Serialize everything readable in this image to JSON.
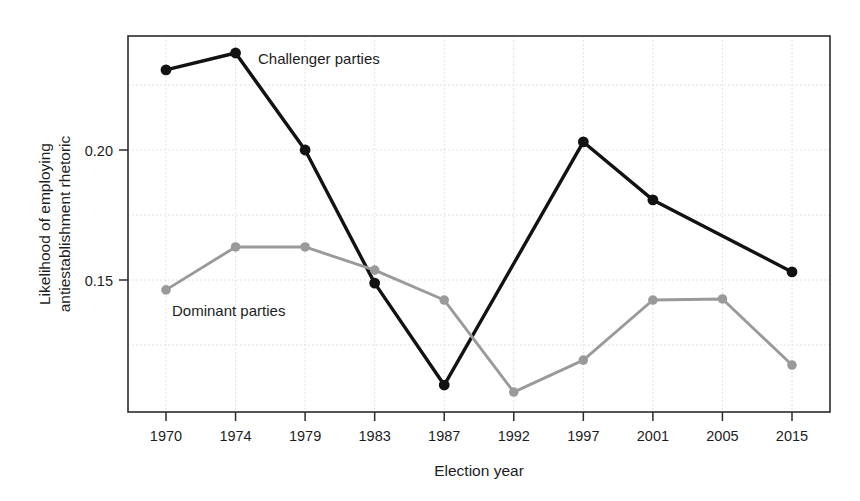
{
  "chart_data": {
    "type": "line",
    "title": "",
    "subtitle": "",
    "xlabel": "Election year",
    "ylabel": "Likelihood of employing antiestablishment rhetoric",
    "ylabel_line1": "Likelihood of employing",
    "ylabel_line2": "antiestablishment rhetoric",
    "categories": [
      "1970",
      "1974",
      "1979",
      "1983",
      "1987",
      "1992",
      "1997",
      "2001",
      "2005",
      "2015"
    ],
    "x": [
      1970,
      1974,
      1979,
      1983,
      1987,
      1992,
      1997,
      2001,
      2005,
      2015
    ],
    "xtick_labels": [
      "1970",
      "1974",
      "1979",
      "1983",
      "1987",
      "1992",
      "1997",
      "2001",
      "2005",
      "2015"
    ],
    "ytick_labels": [
      "0.20",
      "0.15"
    ],
    "ytick_values": [
      0.2,
      0.15
    ],
    "ylim": [
      0.1,
      0.2423
    ],
    "xlim_index": [
      -0.55,
      9.55
    ],
    "grid": true,
    "grid_style": "dotted",
    "legend_position": "inline-annotation",
    "series": [
      {
        "name": "Challenger parties",
        "label": "Challenger parties",
        "color": "#121212",
        "marker": "circle",
        "values": [
          0.2308,
          0.2373,
          0.2,
          0.1488,
          0.1096,
          null,
          0.2031,
          0.1808,
          null,
          0.1531
        ],
        "points": [
          {
            "x": "1970",
            "y": 0.2308
          },
          {
            "x": "1974",
            "y": 0.2373
          },
          {
            "x": "1979",
            "y": 0.2
          },
          {
            "x": "1983",
            "y": 0.1488
          },
          {
            "x": "1987",
            "y": 0.1096
          },
          {
            "x": "1997",
            "y": 0.2031
          },
          {
            "x": "2001",
            "y": 0.1808
          },
          {
            "x": "2015",
            "y": 0.1531
          }
        ]
      },
      {
        "name": "Dominant parties",
        "label": "Dominant parties",
        "color": "#9a9a9a",
        "marker": "circle",
        "values": [
          0.1462,
          0.1627,
          0.1627,
          0.1538,
          0.1423,
          0.1069,
          0.1192,
          0.1423,
          0.1427,
          0.1173
        ],
        "points": [
          {
            "x": "1970",
            "y": 0.1462
          },
          {
            "x": "1974",
            "y": 0.1627
          },
          {
            "x": "1979",
            "y": 0.1627
          },
          {
            "x": "1983",
            "y": 0.1538
          },
          {
            "x": "1987",
            "y": 0.1423
          },
          {
            "x": "1992",
            "y": 0.1069
          },
          {
            "x": "1997",
            "y": 0.1192
          },
          {
            "x": "2001",
            "y": 0.1423
          },
          {
            "x": "2005",
            "y": 0.1427
          },
          {
            "x": "2015",
            "y": 0.1173
          }
        ]
      }
    ],
    "annotations": [
      {
        "text": "Challenger parties",
        "x_px": 258,
        "y_px": 64,
        "anchor": "start"
      },
      {
        "text": "Dominant parties",
        "x_px": 172,
        "y_px": 316,
        "anchor": "start"
      }
    ]
  },
  "colors": {
    "challenger": "#121212",
    "dominant": "#9a9a9a",
    "frame": "#2b2b2b",
    "grid": "#d8d8d8",
    "background": "#ffffff",
    "text": "#1d1d1d"
  }
}
